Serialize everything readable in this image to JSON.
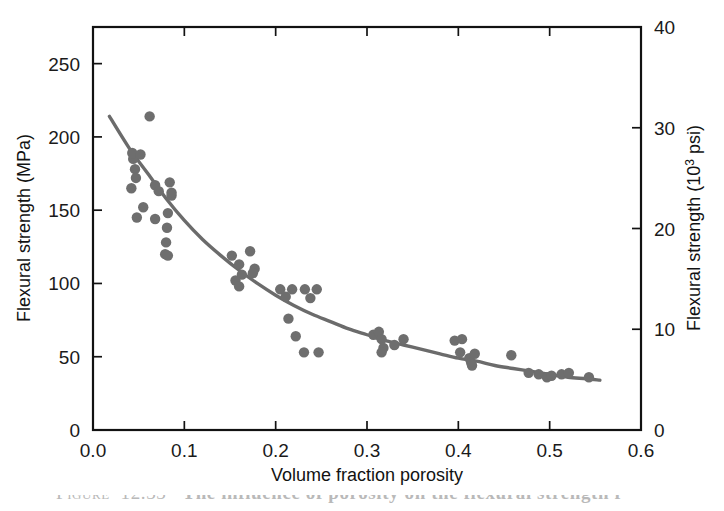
{
  "figure": {
    "caption_prefix": "Figure",
    "caption_number": "12.33",
    "caption_text": "The influence of porosity on the flexural strength f"
  },
  "chart_data": {
    "type": "scatter",
    "title": "",
    "xlabel": "Volume fraction porosity",
    "ylabel": "Flexural strength (MPa)",
    "y2label_main": "Flexural strength (10",
    "y2label_sup": "3",
    "y2label_tail": " psi)",
    "xlim": [
      0.0,
      0.6
    ],
    "ylim": [
      0,
      275
    ],
    "y2lim": [
      0,
      40
    ],
    "grid": false,
    "legend": false,
    "xticks": [
      0.0,
      0.1,
      0.2,
      0.3,
      0.4,
      0.5,
      0.6
    ],
    "xticklabels": [
      "0.0",
      "0.1",
      "0.2",
      "0.3",
      "0.4",
      "0.5",
      "0.6"
    ],
    "yticks": [
      0,
      50,
      100,
      150,
      200,
      250
    ],
    "yticklabels": [
      "0",
      "50",
      "100",
      "150",
      "200",
      "250"
    ],
    "y2ticks": [
      0,
      10,
      20,
      30,
      40
    ],
    "y2ticklabels": [
      "0",
      "10",
      "20",
      "30",
      "40"
    ],
    "points": [
      [
        0.044,
        185
      ],
      [
        0.046,
        178
      ],
      [
        0.047,
        172
      ],
      [
        0.043,
        189
      ],
      [
        0.052,
        188
      ],
      [
        0.042,
        165
      ],
      [
        0.048,
        145
      ],
      [
        0.062,
        214
      ],
      [
        0.055,
        152
      ],
      [
        0.068,
        167
      ],
      [
        0.072,
        163
      ],
      [
        0.084,
        169
      ],
      [
        0.086,
        160
      ],
      [
        0.082,
        148
      ],
      [
        0.081,
        138
      ],
      [
        0.08,
        128
      ],
      [
        0.079,
        120
      ],
      [
        0.082,
        119
      ],
      [
        0.086,
        162
      ],
      [
        0.068,
        144
      ],
      [
        0.152,
        119
      ],
      [
        0.16,
        113
      ],
      [
        0.163,
        106
      ],
      [
        0.156,
        102
      ],
      [
        0.16,
        98
      ],
      [
        0.172,
        122
      ],
      [
        0.177,
        110
      ],
      [
        0.175,
        107
      ],
      [
        0.205,
        96
      ],
      [
        0.218,
        96
      ],
      [
        0.232,
        96
      ],
      [
        0.245,
        96
      ],
      [
        0.238,
        90
      ],
      [
        0.211,
        91
      ],
      [
        0.214,
        76
      ],
      [
        0.222,
        64
      ],
      [
        0.231,
        53
      ],
      [
        0.247,
        53
      ],
      [
        0.307,
        65
      ],
      [
        0.313,
        67
      ],
      [
        0.316,
        62
      ],
      [
        0.318,
        56
      ],
      [
        0.316,
        53
      ],
      [
        0.33,
        58
      ],
      [
        0.34,
        62
      ],
      [
        0.396,
        61
      ],
      [
        0.404,
        62
      ],
      [
        0.402,
        53
      ],
      [
        0.412,
        49
      ],
      [
        0.414,
        46
      ],
      [
        0.415,
        44
      ],
      [
        0.418,
        52
      ],
      [
        0.458,
        51
      ],
      [
        0.477,
        39
      ],
      [
        0.488,
        38
      ],
      [
        0.497,
        36
      ],
      [
        0.502,
        37
      ],
      [
        0.513,
        38
      ],
      [
        0.521,
        39
      ],
      [
        0.543,
        36
      ]
    ],
    "fit_curve": {
      "description": "exponential decay trend line fitted through scatter",
      "x_start": 0.018,
      "x_end": 0.555,
      "y_start": 214,
      "y_end": 34,
      "points": [
        [
          0.018,
          214
        ],
        [
          0.04,
          192
        ],
        [
          0.06,
          175
        ],
        [
          0.08,
          158
        ],
        [
          0.1,
          143
        ],
        [
          0.12,
          130
        ],
        [
          0.14,
          119
        ],
        [
          0.16,
          109
        ],
        [
          0.18,
          100
        ],
        [
          0.2,
          92
        ],
        [
          0.22,
          85
        ],
        [
          0.24,
          79
        ],
        [
          0.26,
          74
        ],
        [
          0.28,
          69
        ],
        [
          0.3,
          65
        ],
        [
          0.32,
          61
        ],
        [
          0.34,
          58
        ],
        [
          0.36,
          55
        ],
        [
          0.38,
          52
        ],
        [
          0.4,
          49
        ],
        [
          0.42,
          47
        ],
        [
          0.44,
          44
        ],
        [
          0.46,
          42
        ],
        [
          0.48,
          40
        ],
        [
          0.5,
          38
        ],
        [
          0.52,
          36
        ],
        [
          0.54,
          35
        ],
        [
          0.555,
          34
        ]
      ]
    }
  }
}
